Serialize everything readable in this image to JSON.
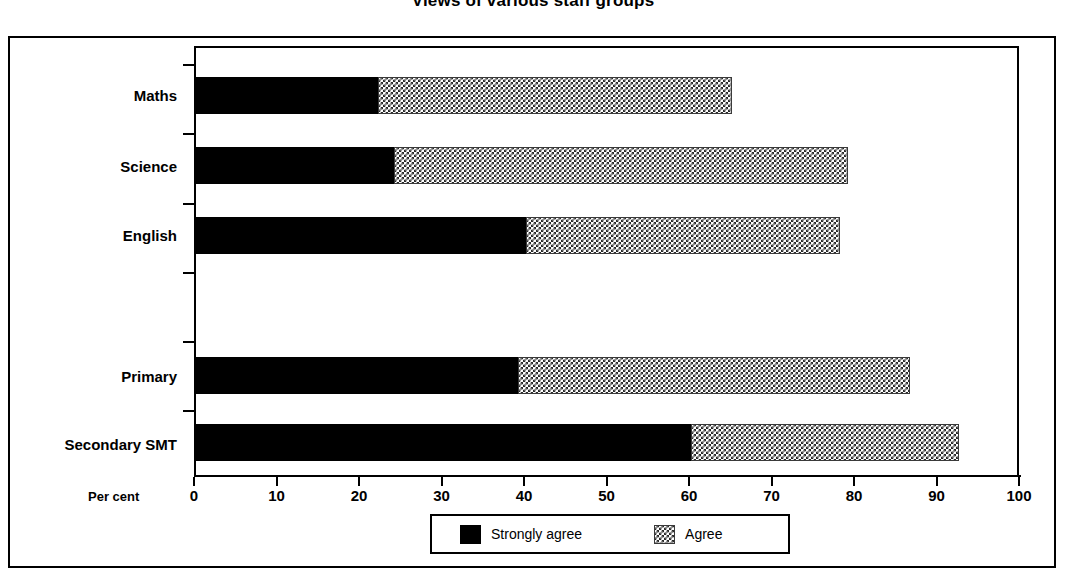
{
  "chart_data": {
    "type": "bar",
    "orientation": "horizontal",
    "stacked": true,
    "title": "Views of various staff groups",
    "xlabel": "Per cent",
    "ylabel": "",
    "xlim": [
      0,
      100
    ],
    "xticks": [
      0,
      10,
      20,
      30,
      40,
      50,
      60,
      70,
      80,
      90,
      100
    ],
    "xtick_labels": [
      "0",
      "10",
      "20",
      "30",
      "40",
      "50",
      "60",
      "70",
      "80",
      "90",
      "100"
    ],
    "grid": false,
    "legend_position": "bottom-center",
    "categories": [
      "Maths",
      "Science",
      "English",
      "",
      "Primary",
      "Secondary SMT"
    ],
    "series": [
      {
        "name": "Strongly agree",
        "color": "#000000",
        "pattern": "solid",
        "values": [
          22,
          24,
          40,
          null,
          39,
          60
        ]
      },
      {
        "name": "Agree",
        "color": "#2a2a2a",
        "pattern": "checkerboard",
        "values": [
          43,
          55,
          38,
          null,
          47.5,
          32.5
        ]
      }
    ],
    "totals": [
      65,
      79,
      78,
      null,
      86.5,
      92.5
    ]
  },
  "legend": {
    "items": [
      {
        "label": "Strongly agree",
        "swatch": "solid-black-swatch"
      },
      {
        "label": "Agree",
        "swatch": "checkered-swatch"
      }
    ]
  }
}
